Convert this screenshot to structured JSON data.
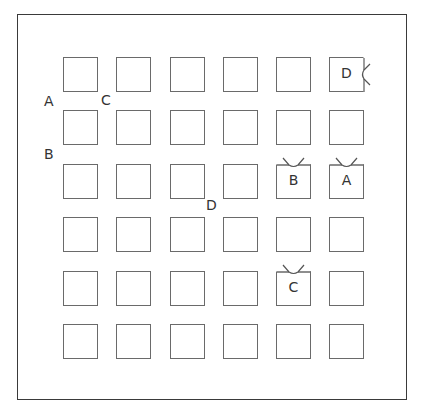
{
  "diagram": {
    "grid": {
      "rows": 6,
      "cols": 6
    },
    "outer_labels": [
      {
        "text": "A",
        "x": 44,
        "y": 93
      },
      {
        "text": "C",
        "x": 101,
        "y": 92
      },
      {
        "text": "B",
        "x": 44,
        "y": 146
      },
      {
        "text": "D",
        "x": 206,
        "y": 197
      }
    ],
    "square_labels": [
      {
        "row": 0,
        "col": 5,
        "text": "D",
        "notch": "right"
      },
      {
        "row": 2,
        "col": 4,
        "text": "B",
        "notch": "top"
      },
      {
        "row": 2,
        "col": 5,
        "text": "A",
        "notch": "top"
      },
      {
        "row": 4,
        "col": 4,
        "text": "C",
        "notch": "top"
      }
    ],
    "colors": {
      "frame": "#3a3a3a",
      "square": "#6a6a6a",
      "text": "#333333"
    }
  }
}
